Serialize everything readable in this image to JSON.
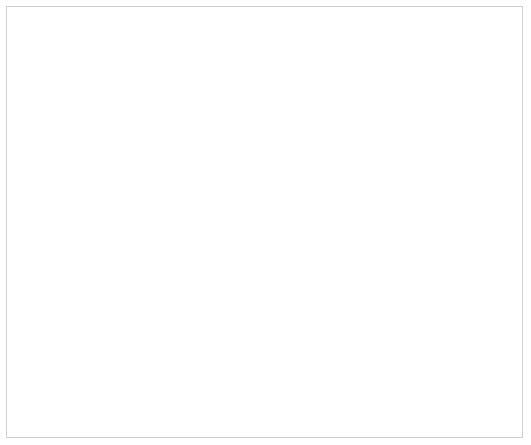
{
  "chart_data": {
    "type": "line",
    "title": "",
    "xlabel": "時 間 〔秒〕",
    "ylabel": "電 流 〔A〕",
    "x_scale": "log",
    "y_scale": "log",
    "xlim": [
      0.01,
      2.0
    ],
    "ylim": [
      100,
      175000
    ],
    "grid": true,
    "x_ticks": [
      "0.01",
      "0.02",
      "0.04",
      "0.06",
      "0.08",
      "0.1",
      "0.2",
      "0.4",
      "0.6",
      "0.8",
      "1.0",
      "2.0"
    ],
    "y_ticks": [
      "1×10²",
      "2",
      "4",
      "6",
      "8",
      "1×10³",
      "2",
      "4",
      "6",
      "8",
      "1×10⁴",
      "2",
      "4",
      "6",
      "8",
      "1×10⁵"
    ],
    "legend_position": "inline labels at right edge",
    "series": [
      {
        "name": "1000mm²",
        "current_at_0.01s": 143000,
        "slope": -0.5
      },
      {
        "name": "800mm²",
        "current_at_0.01s": 98000,
        "slope": -0.5
      },
      {
        "name": "600mm²",
        "current_at_0.01s": 75000,
        "slope": -0.5
      },
      {
        "name": "500mm²",
        "current_at_0.01s": 60000,
        "slope": -0.5
      },
      {
        "name": "400mm²",
        "current_at_0.01s": 48000,
        "slope": -0.5
      },
      {
        "name": "325mm²",
        "current_at_0.01s": 38500,
        "slope": -0.5
      },
      {
        "name": "250mm²",
        "current_at_0.01s": 30000,
        "slope": -0.5
      },
      {
        "name": "200mm²",
        "current_at_0.01s": 24500,
        "slope": -0.5
      },
      {
        "name": "150mm²",
        "current_at_0.01s": 18000,
        "slope": -0.5
      },
      {
        "name": "100mm²",
        "current_at_0.01s": 12000,
        "slope": -0.5
      },
      {
        "name": "60mm²",
        "current_at_0.01s": 7200,
        "slope": -0.5
      },
      {
        "name": "38mm²",
        "current_at_0.01s": 4700,
        "slope": -0.5
      },
      {
        "name": "22mm²",
        "current_at_0.01s": 2650,
        "slope": -0.5
      },
      {
        "name": "14mm²",
        "current_at_0.01s": 1650,
        "slope": -0.5
      },
      {
        "name": "8mm²",
        "current_at_0.01s": 830,
        "slope": -0.5
      },
      {
        "name": "2.6mm²",
        "current_at_0.01s": 630,
        "slope": -0.5
      }
    ],
    "annotations": [
      {
        "type": "point",
        "x": 0.1,
        "y": 1450,
        "style": "open circle with dotted arrow from y-axis"
      }
    ]
  },
  "labels": {
    "y_axis_char1": "電",
    "y_axis_char2": "流",
    "y_axis_unit": "〔A〕",
    "x_axis_title": "時　間　〔秒〕"
  },
  "colors": {
    "plot_fill": "#d9d9d9",
    "line": "#222222",
    "grid": "#999999",
    "text": "#555555"
  }
}
